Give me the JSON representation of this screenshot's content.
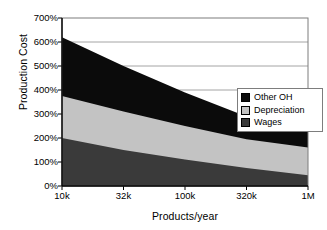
{
  "chart_data": {
    "type": "area",
    "title": "",
    "subtitle": "",
    "xlabel": "Products/year",
    "ylabel": "Production Cost",
    "stacked": true,
    "grid": true,
    "grid_axis": "y",
    "legend_position": "right-middle",
    "x_scale": "log",
    "x_tick_labels": [
      "10k",
      "32k",
      "100k",
      "320k",
      "1M"
    ],
    "x_tick_values": [
      10000,
      32000,
      100000,
      320000,
      1000000
    ],
    "y_tick_labels": [
      "0%",
      "100%",
      "200%",
      "300%",
      "400%",
      "500%",
      "600%",
      "700%"
    ],
    "y_tick_values": [
      0,
      100,
      200,
      300,
      400,
      500,
      600,
      700
    ],
    "ylim": [
      0,
      700
    ],
    "y_unit": "%",
    "categories": [
      "10k",
      "32k",
      "100k",
      "320k",
      "1M"
    ],
    "series": [
      {
        "name": "Wages",
        "color": "#3a3a3a",
        "values": [
          200,
          150,
          110,
          75,
          45
        ]
      },
      {
        "name": "Depreciation",
        "color": "#c3c3c3",
        "values": [
          175,
          160,
          140,
          120,
          115
        ]
      },
      {
        "name": "Other OH",
        "color": "#0b0b0b",
        "values": [
          245,
          190,
          140,
          95,
          65
        ]
      }
    ],
    "cumulative_tops": {
      "wages": [
        200,
        150,
        110,
        75,
        45
      ],
      "depreciation": [
        375,
        310,
        250,
        195,
        160
      ],
      "other_oh": [
        620,
        500,
        390,
        290,
        225
      ]
    },
    "total": [
      620,
      500,
      390,
      290,
      225
    ]
  },
  "legend": {
    "items": [
      {
        "label": "Other OH",
        "color": "#0b0b0b"
      },
      {
        "label": "Depreciation",
        "color": "#c3c3c3"
      },
      {
        "label": "Wages",
        "color": "#3a3a3a"
      }
    ]
  },
  "style": {
    "frame_color": "#7d7d7d",
    "grid_color": "#9a9a9a",
    "axis_color": "#000000",
    "background": "#ffffff"
  }
}
